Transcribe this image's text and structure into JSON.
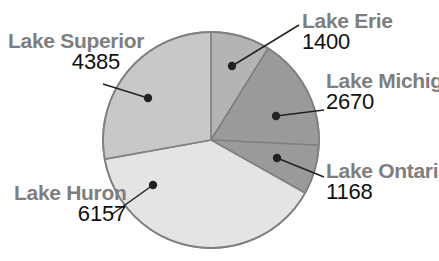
{
  "chart_data": {
    "type": "pie",
    "title": "",
    "xlabel": "",
    "ylabel": "",
    "categories": [
      "Lake Erie",
      "Lake Michigan",
      "Lake Ontario",
      "Lake Huron",
      "Lake Superior"
    ],
    "values": [
      1400,
      2670,
      1168,
      6157,
      4385
    ],
    "total": 15780,
    "legend_position": "none",
    "grid": false,
    "labels_show_value": true,
    "slices": [
      {
        "name": "Lake Erie",
        "value": 1400,
        "name_text": "Lake Erie",
        "value_text": "1400",
        "color": "#b4b4b4",
        "start_angle": 0,
        "end_angle": 31.9,
        "leader_dot": {
          "x": 232,
          "y": 66
        },
        "leader_end": {
          "x": 299,
          "y": 25
        }
      },
      {
        "name": "Lake Michigan",
        "value": 2670,
        "name_text": "Lake Michigan",
        "value_text": "2670",
        "color": "#9a9a9a",
        "start_angle": 31.9,
        "end_angle": 92.8,
        "leader_dot": {
          "x": 276,
          "y": 116
        },
        "leader_end": {
          "x": 324,
          "y": 110
        }
      },
      {
        "name": "Lake Ontario",
        "value": 1168,
        "name_text": "Lake Ontario",
        "value_text": "1168",
        "color": "#9a9a9a",
        "start_angle": 92.8,
        "end_angle": 119.4,
        "leader_dot": {
          "x": 277,
          "y": 158
        },
        "leader_end": {
          "x": 324,
          "y": 177
        }
      },
      {
        "name": "Lake Huron",
        "value": 6157,
        "name_text": "Lake Huron",
        "value_text": "6157",
        "color": "#e4e4e4",
        "start_angle": 119.4,
        "end_angle": 259.8,
        "leader_dot": {
          "x": 153,
          "y": 185
        },
        "leader_end": {
          "x": 111,
          "y": 215
        }
      },
      {
        "name": "Lake Superior",
        "value": 4385,
        "name_text": "Lake Superior",
        "value_text": "4385",
        "color": "#c8c8c8",
        "start_angle": 259.8,
        "end_angle": 360,
        "leader_dot": {
          "x": 148,
          "y": 98
        },
        "leader_end": {
          "x": 103,
          "y": 84
        }
      }
    ],
    "geometry": {
      "center_x": 211,
      "center_y": 140,
      "radius": 108,
      "outline_color": "#808080",
      "leader_color": "#222222",
      "background": "#ffffff"
    }
  }
}
